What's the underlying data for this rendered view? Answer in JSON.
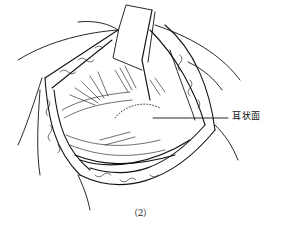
{
  "figure": {
    "label": "耳状面",
    "caption": "（2）",
    "line_color": "#111111",
    "background": "#ffffff"
  }
}
